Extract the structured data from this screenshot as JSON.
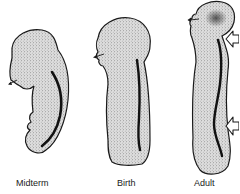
{
  "figure": {
    "stages": [
      {
        "id": "midterm",
        "label": "Midterm"
      },
      {
        "id": "birth",
        "label": "Birth"
      },
      {
        "id": "adult",
        "label": "Adult"
      }
    ],
    "colors": {
      "outline": "#1a1a1a",
      "fill": "#d9d9d9",
      "stipple": "#5a5a5a",
      "spine": "#111111",
      "background": "#ffffff"
    },
    "annotations": {
      "small_arrows": "gaze-direction arrows at face of each figure",
      "hollow_arrows": "two hollow arrows on adult figure marking cervical and lumbar curves"
    }
  }
}
